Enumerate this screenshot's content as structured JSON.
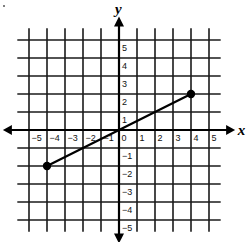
{
  "chart_data": {
    "type": "line",
    "title": "",
    "xlabel": "x",
    "ylabel": "y",
    "xlim": [
      -5,
      5
    ],
    "ylim": [
      -5,
      5
    ],
    "grid": true,
    "x_ticks": [
      -5,
      -4,
      -3,
      -2,
      -1,
      0,
      1,
      2,
      3,
      4,
      5
    ],
    "y_ticks": [
      -5,
      -4,
      -3,
      -2,
      -1,
      1,
      2,
      3,
      4,
      5
    ],
    "x_tick_labels": [
      "−5",
      "−4",
      "−3",
      "−2",
      "−1",
      "0",
      "1",
      "2",
      "3",
      "4",
      "5"
    ],
    "y_tick_labels": [
      "−5",
      "−4",
      "−3",
      "−2",
      "−1",
      "1",
      "2",
      "3",
      "4",
      "5"
    ],
    "series": [
      {
        "name": "segment",
        "points": [
          [
            -4,
            -2
          ],
          [
            4,
            2
          ]
        ],
        "endpoints_marked": true,
        "color": "#000000"
      }
    ],
    "legend": null
  },
  "layout": {
    "origin_px": [
      119,
      130
    ],
    "unit_px": 18,
    "grid_color": "#1a1a1a",
    "axis_color": "#000000"
  }
}
